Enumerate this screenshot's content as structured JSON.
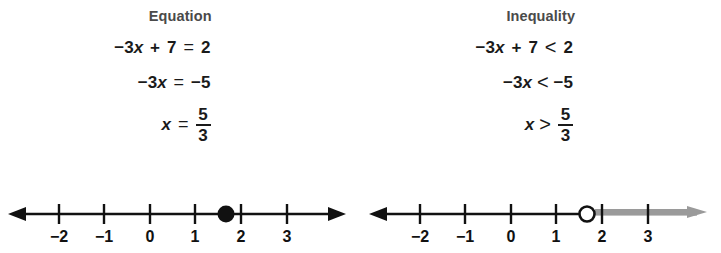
{
  "figure": {
    "background": "#ffffff",
    "ink": "#111111",
    "shade_color": "#9a9a9a",
    "heading_color": "#4a4a4a"
  },
  "panels": [
    {
      "id": "equation",
      "title": "Equation",
      "lines": [
        {
          "id": "line-1",
          "text": "-3x + 7 = 2",
          "parts": {
            "coef": "−3",
            "var": "x",
            "plus": "+",
            "const": "7",
            "rel": "=",
            "rhs": "2"
          }
        },
        {
          "id": "line-2",
          "text": "-3x = -5",
          "parts": {
            "coef": "−3",
            "var": "x",
            "rel": "=",
            "rhs": "−5"
          }
        },
        {
          "id": "line-3",
          "text": "x = 5/3",
          "parts": {
            "var": "x",
            "rel": "=",
            "numerator": "5",
            "denominator": "3"
          }
        }
      ],
      "numberline": {
        "ticks": [
          {
            "value": -2,
            "label": "−2"
          },
          {
            "value": -1,
            "label": "−1"
          },
          {
            "value": 0,
            "label": "0"
          },
          {
            "value": 1,
            "label": "1"
          },
          {
            "value": 2,
            "label": "2"
          },
          {
            "value": 3,
            "label": "3"
          }
        ],
        "point": {
          "value": 1.6667,
          "label": "5/3",
          "style": "closed"
        },
        "shading": "none",
        "left_arrow": true,
        "right_arrow": true
      }
    },
    {
      "id": "inequality",
      "title": "Inequality",
      "lines": [
        {
          "id": "line-1",
          "text": "-3x + 7 < 2",
          "parts": {
            "coef": "−3",
            "var": "x",
            "plus": "+",
            "const": "7",
            "rel": "<",
            "rhs": "2"
          }
        },
        {
          "id": "line-2",
          "text": "-3x < -5",
          "parts": {
            "coef": "−3",
            "var": "x",
            "rel": "<",
            "rhs": "−5"
          }
        },
        {
          "id": "line-3",
          "text": "x > 5/3",
          "parts": {
            "var": "x",
            "rel": ">",
            "numerator": "5",
            "denominator": "3"
          }
        }
      ],
      "numberline": {
        "ticks": [
          {
            "value": -2,
            "label": "−2"
          },
          {
            "value": -1,
            "label": "−1"
          },
          {
            "value": 0,
            "label": "0"
          },
          {
            "value": 1,
            "label": "1"
          },
          {
            "value": 2,
            "label": "2"
          },
          {
            "value": 3,
            "label": "3"
          }
        ],
        "point": {
          "value": 1.6667,
          "label": "5/3",
          "style": "open"
        },
        "shading": "right",
        "left_arrow": true,
        "right_arrow": true
      }
    }
  ]
}
